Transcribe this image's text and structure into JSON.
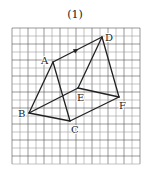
{
  "figure": {
    "title": "(1)",
    "grid": {
      "x0": 12,
      "y0": 28,
      "cell": 8,
      "cols": 16,
      "rows": 17,
      "line_color": "#9a9a9a",
      "major_color": "#555555"
    },
    "vertices": {
      "A": {
        "x": 53,
        "y": 62,
        "label": "A",
        "lx": -12,
        "ly": 2
      },
      "B": {
        "x": 29,
        "y": 113,
        "label": "B",
        "lx": -11,
        "ly": 4
      },
      "C": {
        "x": 70,
        "y": 121,
        "label": "C",
        "lx": 1,
        "ly": 12
      },
      "D": {
        "x": 102,
        "y": 37,
        "label": "D",
        "lx": 3,
        "ly": 4
      },
      "E": {
        "x": 78,
        "y": 88,
        "label": "E",
        "lx": -1,
        "ly": 13
      },
      "F": {
        "x": 119,
        "y": 97,
        "label": "F",
        "lx": 0,
        "ly": 12
      }
    },
    "edges": [
      [
        "A",
        "B"
      ],
      [
        "A",
        "C"
      ],
      [
        "B",
        "C"
      ],
      [
        "B",
        "E"
      ],
      [
        "E",
        "F"
      ],
      [
        "C",
        "F"
      ],
      [
        "D",
        "E"
      ],
      [
        "D",
        "F"
      ],
      [
        "A",
        "D"
      ]
    ],
    "arrow": {
      "from": "A",
      "to": "D",
      "at": 0.52
    },
    "stroke_color": "#222222"
  }
}
